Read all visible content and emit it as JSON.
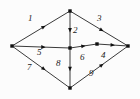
{
  "figure": {
    "background_color": "#fcfcfc",
    "stroke_color": "#3a3a3a",
    "node_color": "#111111",
    "label_color": "#1a1a1a",
    "width": 140,
    "height": 99
  },
  "nodes": [
    {
      "id": "top",
      "name": "node-top",
      "x": 70,
      "y": 11
    },
    {
      "id": "left",
      "name": "node-left",
      "x": 12,
      "y": 46
    },
    {
      "id": "right",
      "name": "node-right",
      "x": 128,
      "y": 46
    },
    {
      "id": "bottom",
      "name": "node-bottom",
      "x": 70,
      "y": 88
    },
    {
      "id": "center",
      "name": "node-center",
      "x": 70,
      "y": 48
    },
    {
      "id": "midright",
      "name": "node-mid-right",
      "x": 97,
      "y": 44
    }
  ],
  "edges": [
    {
      "label": "1",
      "from": "left",
      "to": "top",
      "lx": 28,
      "ly": 14
    },
    {
      "label": "2",
      "from": "top",
      "to": "center",
      "lx": 73,
      "ly": 26
    },
    {
      "label": "3",
      "from": "top",
      "to": "right",
      "lx": 97,
      "ly": 14
    },
    {
      "label": "4",
      "from": "midright",
      "to": "right",
      "lx": 101,
      "ly": 51
    },
    {
      "label": "5",
      "from": "left",
      "to": "center",
      "lx": 37,
      "ly": 48
    },
    {
      "label": "6",
      "from": "center",
      "to": "midright",
      "lx": 80,
      "ly": 53
    },
    {
      "label": "7",
      "from": "left",
      "to": "bottom",
      "lx": 27,
      "ly": 63
    },
    {
      "label": "8",
      "from": "center",
      "to": "bottom",
      "lx": 56,
      "ly": 59
    },
    {
      "label": "9",
      "from": "bottom",
      "to": "right",
      "lx": 89,
      "ly": 69
    }
  ]
}
